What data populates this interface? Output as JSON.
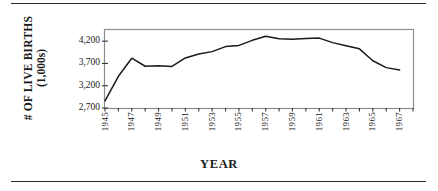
{
  "figure": {
    "y_axis_title_line1": "# OF LIVE BIRTHS",
    "y_axis_title_line2": "(1,000s)",
    "x_axis_title": "YEAR",
    "line_color": "#1a1a1a",
    "frame_color": "#8d8d8d",
    "rule_color": "#2b2b2b"
  },
  "chart_data": {
    "type": "line",
    "title": "",
    "xlabel": "YEAR",
    "ylabel": "# OF LIVE BIRTHS (1,000s)",
    "ylim": [
      2700,
      4450
    ],
    "xlim": [
      1945,
      1968
    ],
    "ytick_values": [
      2700,
      3200,
      3700,
      4200
    ],
    "ytick_labels": [
      "2,700",
      "3,200",
      "3,700",
      "4,200"
    ],
    "xtick_values": [
      1945,
      1946,
      1947,
      1948,
      1949,
      1950,
      1951,
      1952,
      1953,
      1954,
      1955,
      1956,
      1957,
      1958,
      1959,
      1960,
      1961,
      1962,
      1963,
      1964,
      1965,
      1966,
      1967,
      1968
    ],
    "xtick_labels_shown": [
      "1945",
      "1947",
      "1949",
      "1951",
      "1953",
      "1955",
      "1957",
      "1959",
      "1961",
      "1963",
      "1965",
      "1967"
    ],
    "grid": false,
    "legend": false,
    "series": [
      {
        "name": "# of live births (1,000s)",
        "x": [
          1945,
          1946,
          1947,
          1948,
          1949,
          1950,
          1951,
          1952,
          1953,
          1954,
          1955,
          1956,
          1957,
          1958,
          1959,
          1960,
          1961,
          1962,
          1963,
          1964,
          1965,
          1966,
          1967
        ],
        "values": [
          2858,
          3411,
          3817,
          3637,
          3649,
          3632,
          3823,
          3913,
          3965,
          4078,
          4104,
          4218,
          4308,
          4255,
          4245,
          4258,
          4268,
          4167,
          4098,
          4027,
          3760,
          3606,
          3555
        ]
      }
    ]
  }
}
